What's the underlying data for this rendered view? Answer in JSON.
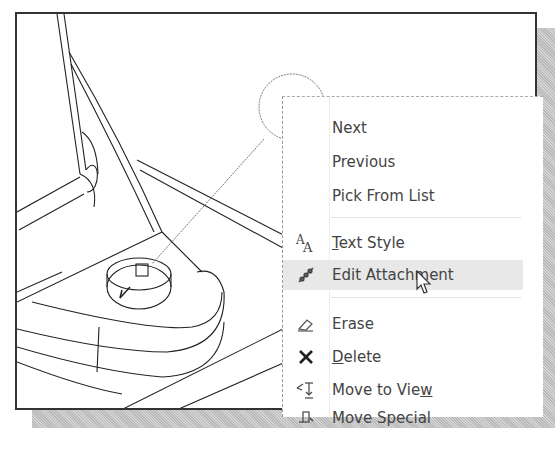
{
  "drawing": {
    "balloon_label": "3"
  },
  "context_menu": {
    "items": [
      {
        "id": "next",
        "label": "Next",
        "icon": "none"
      },
      {
        "id": "previous",
        "label": "Previous",
        "icon": "none"
      },
      {
        "id": "pick-from-list",
        "label": "Pick From List",
        "icon": "none"
      },
      {
        "id": "text-style",
        "label": "Text Style",
        "mnemonic": "T",
        "icon": "text-style-icon"
      },
      {
        "id": "edit-attachment",
        "label": "Edit Attachment",
        "icon": "edit-attachment-icon",
        "highlighted": true
      },
      {
        "id": "erase",
        "label": "Erase",
        "icon": "eraser-icon"
      },
      {
        "id": "delete",
        "label": "Delete",
        "mnemonic": "D",
        "icon": "delete-x-icon"
      },
      {
        "id": "move-to-view",
        "label": "Move to View",
        "mnemonic": "w",
        "icon": "move-to-view-icon"
      },
      {
        "id": "move-special",
        "label": "Move Special",
        "icon": "move-special-icon"
      }
    ],
    "text_style_rest": "ext Style",
    "text_style_mn": "T",
    "delete_rest": "elete",
    "delete_mn": "D",
    "move_view_pre": "Move to Vie",
    "move_view_mn": "w"
  },
  "colors": {
    "menu_text": "#444444",
    "highlight": "#e8e8e8",
    "frame": "#333333"
  }
}
